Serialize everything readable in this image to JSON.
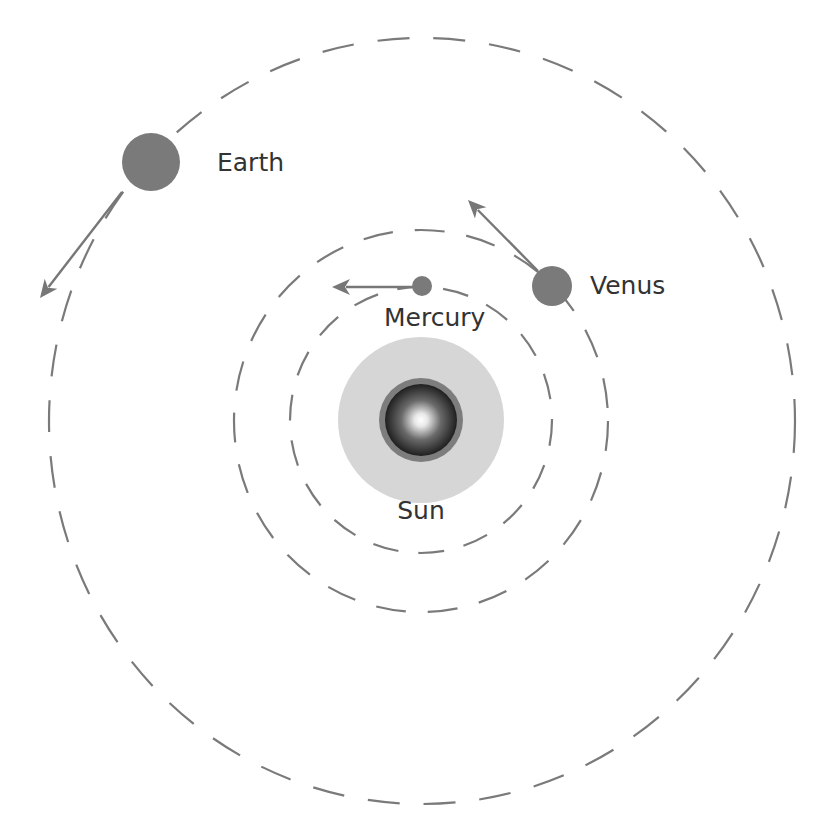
{
  "diagram": {
    "colors": {
      "background": "#ffffff",
      "orbit": "#7a7a7a",
      "planet": "#7a7a7a",
      "arrow": "#777777",
      "sun_halo": "#d6d6d6",
      "sun_ring": "#7d7d7d",
      "sun_core_center": "#ffffff",
      "sun_core_edge": "#1f1f1f",
      "label": "#333333"
    },
    "sun": {
      "label": "Sun",
      "cx": 421,
      "cy": 420,
      "halo_radius": 83,
      "ring_radius": 42,
      "core_radius": 36
    },
    "orbits": [
      {
        "name": "Mercury orbit",
        "cx": 421,
        "cy": 420,
        "rx": 131,
        "ry": 133,
        "dash": "26 20"
      },
      {
        "name": "Venus orbit",
        "cx": 421,
        "cy": 421,
        "rx": 187,
        "ry": 191,
        "dash": "30 22"
      },
      {
        "name": "Earth orbit",
        "cx": 422,
        "cy": 421,
        "rx": 373,
        "ry": 383,
        "dash": "32 24"
      }
    ],
    "planets": [
      {
        "name": "Mercury",
        "label": "Mercury",
        "cx": 422,
        "cy": 286,
        "r": 10,
        "label_x": 384,
        "label_y": 326,
        "arrow": {
          "x1": 412,
          "y1": 287,
          "x2": 332,
          "y2": 287
        }
      },
      {
        "name": "Venus",
        "label": "Venus",
        "cx": 552,
        "cy": 286,
        "r": 20,
        "label_x": 590,
        "label_y": 287,
        "arrow": {
          "x1": 538,
          "y1": 271,
          "x2": 468,
          "y2": 200
        }
      },
      {
        "name": "Earth",
        "label": "Earth",
        "cx": 151,
        "cy": 162,
        "r": 29,
        "label_x": 217,
        "label_y": 171,
        "arrow": {
          "x1": 122,
          "y1": 192,
          "x2": 40,
          "y2": 298
        }
      }
    ]
  }
}
